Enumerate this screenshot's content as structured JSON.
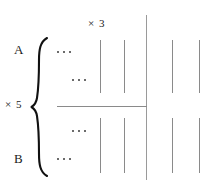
{
  "figure": {
    "title_text": "",
    "background_color": "#ffffff",
    "line_color": "#8a8a8a",
    "brace_color": "#111111",
    "text_color": "#1a1a1a"
  },
  "labels": {
    "column_multiplier": "× 3",
    "row_multiplier": "× 5",
    "row_top": "A",
    "row_bottom": "B"
  },
  "ellipses": {
    "top_outer": "...",
    "top_inner": "...",
    "bottom_inner": "...",
    "bottom_outer": "..."
  },
  "ticks": {
    "upper_row": [
      100,
      124,
      172,
      199
    ],
    "lower_row": [
      100,
      124,
      172,
      199
    ],
    "upper_y": 40,
    "upper_height": 53,
    "lower_y": 118,
    "lower_height": 55,
    "divider_x": 146,
    "divider_y": 15,
    "divider_height": 165
  },
  "rules": {
    "horizontal_x": 57,
    "horizontal_y": 106,
    "horizontal_width": 90
  },
  "brace": {
    "x": 30,
    "y": 36,
    "width": 20,
    "height": 140
  }
}
